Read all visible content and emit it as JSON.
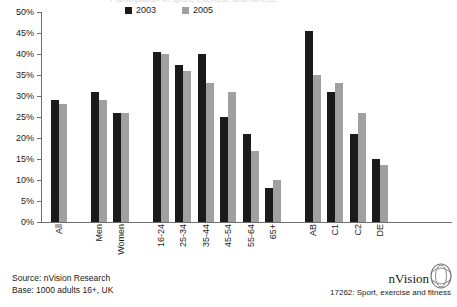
{
  "title": {
    "text": "Participation in sport, exercise and fitness",
    "visible": "partially cut off at top edge"
  },
  "legend": {
    "position": "top-center",
    "items": [
      {
        "label": "2003",
        "color": "#1a1a1a",
        "swatch": "square-swatch"
      },
      {
        "label": "2005",
        "color": "#a0a0a0",
        "swatch": "square-swatch"
      }
    ]
  },
  "axis": {
    "y_ticks": [
      "0%",
      "5%",
      "10%",
      "15%",
      "20%",
      "25%",
      "30%",
      "35%",
      "40%",
      "45%",
      "50%"
    ]
  },
  "footer": {
    "source": "Source: nVision Research",
    "base": "Base: 1000 adults 16+, UK",
    "brand": "nVision",
    "brand_mark": "nvision-eye-logo",
    "reference": "17262: Sport, exercise and fitness"
  },
  "chart_data": {
    "type": "bar",
    "title": "Participation in sport, exercise and fitness",
    "xlabel": "",
    "ylabel": "",
    "ylim": [
      0,
      50
    ],
    "ytick_step": 5,
    "ytick_format": "percent",
    "grid": false,
    "legend_position": "top-center",
    "categories": [
      "All",
      "Men",
      "Women",
      "16-24",
      "25-34",
      "35-44",
      "45-54",
      "55-64",
      "65+",
      "AB",
      "C1",
      "C2",
      "DE"
    ],
    "group_breaks_after": [
      "All",
      "Women",
      "65+"
    ],
    "series": [
      {
        "name": "2003",
        "color": "#1a1a1a",
        "values": [
          29,
          31,
          26,
          40.5,
          37.5,
          40,
          25,
          21,
          8,
          45.5,
          31,
          21,
          15
        ]
      },
      {
        "name": "2005",
        "color": "#a0a0a0",
        "values": [
          28,
          29,
          26,
          40,
          36,
          33,
          31,
          17,
          10,
          35,
          33,
          26,
          13.5
        ]
      }
    ]
  }
}
